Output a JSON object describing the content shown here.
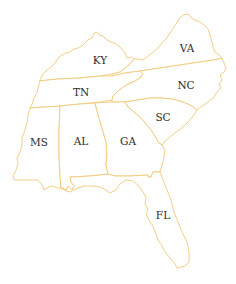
{
  "map": {
    "title": "",
    "stroke_color": "#f0c878",
    "fill_color": "#ffffff",
    "label_color": "#2b2b2b",
    "states": [
      {
        "abbr": "KY",
        "label": "KY",
        "label_x": 100,
        "label_y": 64
      },
      {
        "abbr": "VA",
        "label": "VA",
        "label_x": 187,
        "label_y": 52
      },
      {
        "abbr": "TN",
        "label": "TN",
        "label_x": 81,
        "label_y": 96
      },
      {
        "abbr": "NC",
        "label": "NC",
        "label_x": 186,
        "label_y": 89
      },
      {
        "abbr": "SC",
        "label": "SC",
        "label_x": 163,
        "label_y": 121
      },
      {
        "abbr": "MS",
        "label": "MS",
        "label_x": 39,
        "label_y": 146
      },
      {
        "abbr": "AL",
        "label": "AL",
        "label_x": 81,
        "label_y": 145
      },
      {
        "abbr": "GA",
        "label": "GA",
        "label_x": 128,
        "label_y": 145
      },
      {
        "abbr": "FL",
        "label": "FL",
        "label_x": 163,
        "label_y": 219
      }
    ]
  }
}
